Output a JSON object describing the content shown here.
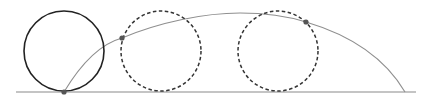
{
  "diagram": {
    "ground_line": {
      "x1": 16,
      "y1": 92,
      "x2": 416,
      "y2": 92,
      "color": "#8a8a8a"
    },
    "circles": [
      {
        "id": "start",
        "cx": 64,
        "cy": 51,
        "r": 40,
        "style": "solid",
        "color": "#222222"
      },
      {
        "id": "mid",
        "cx": 161,
        "cy": 51,
        "r": 40,
        "style": "dashed",
        "color": "#333333"
      },
      {
        "id": "late",
        "cx": 278,
        "cy": 51,
        "r": 40,
        "style": "dashed",
        "color": "#333333"
      }
    ],
    "trajectory": {
      "path": "M64,92 C82,62 100,44 122,38 C160,22 205,13 240,13 C270,13 290,17 306,22 C350,35 385,58 405,92",
      "color": "#8f8f8f"
    },
    "points": [
      {
        "id": "p1",
        "x": 64,
        "y": 92,
        "r": 2.6,
        "color": "#555555"
      },
      {
        "id": "p2",
        "x": 122,
        "y": 38,
        "r": 2.6,
        "color": "#555555"
      },
      {
        "id": "p3",
        "x": 306,
        "y": 22,
        "r": 2.6,
        "color": "#555555"
      }
    ]
  }
}
